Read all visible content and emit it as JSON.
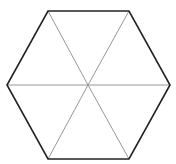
{
  "diagram": {
    "shape": "regular hexagon divided into 6 triangles",
    "center": [
      88,
      85
    ],
    "vertices": [
      [
        48,
        11
      ],
      [
        129,
        11
      ],
      [
        170,
        85
      ],
      [
        129,
        159
      ],
      [
        48,
        159
      ],
      [
        7,
        85
      ]
    ],
    "colors": {
      "background": "#ffffff",
      "outline": "#222222",
      "spokes": "#8a8a8a"
    },
    "stroke_widths": {
      "outline": 1.6,
      "spokes": 0.9
    }
  }
}
